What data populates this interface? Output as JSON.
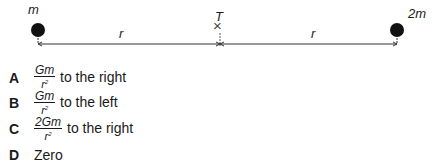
{
  "diagram": {
    "left_mass_label": "m",
    "right_mass_label": "2m",
    "point_label": "T",
    "left_distance_label": "r",
    "right_distance_label": "r",
    "point_marker": "×"
  },
  "options": [
    {
      "letter": "A",
      "numerator": "Gm",
      "denominator": "r",
      "exponent": "2",
      "text": "to the right"
    },
    {
      "letter": "B",
      "numerator": "Gm",
      "denominator": "r",
      "exponent": "2",
      "text": "to the left"
    },
    {
      "letter": "C",
      "numerator": "2Gm",
      "denominator": "r",
      "exponent": "2",
      "text": "to the right"
    },
    {
      "letter": "D",
      "text": "Zero"
    }
  ]
}
